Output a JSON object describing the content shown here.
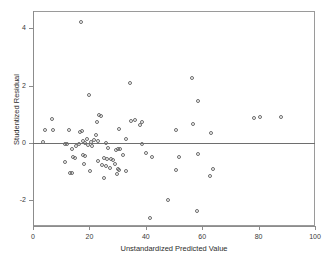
{
  "chart_data": {
    "type": "scatter",
    "title": "",
    "xlabel": "Unstandardized Predicted Value",
    "ylabel": "Studentized Residual",
    "xlim": [
      0,
      100
    ],
    "ylim": [
      -2.9,
      4.6
    ],
    "xticks": [
      0,
      20,
      40,
      60,
      80,
      100
    ],
    "xticklabels": [
      "0",
      "20",
      "40",
      "60",
      "80",
      "100"
    ],
    "yticks": [
      4,
      2,
      0,
      -2
    ],
    "yticklabels": [
      "4",
      "2",
      "0",
      "-2"
    ],
    "grid": false,
    "legend": null,
    "reference_line": {
      "type": "horizontal",
      "y": 0
    },
    "marker": {
      "shape": "circle",
      "filled": false,
      "edge_color": "#6b6b6b",
      "size": 4
    },
    "points": [
      {
        "x": 17.0,
        "y": 4.22
      },
      {
        "x": 56.5,
        "y": 2.25
      },
      {
        "x": 34.5,
        "y": 2.1
      },
      {
        "x": 19.8,
        "y": 1.67
      },
      {
        "x": 58.5,
        "y": 1.47
      },
      {
        "x": 23.4,
        "y": 0.97
      },
      {
        "x": 24.1,
        "y": 0.95
      },
      {
        "x": 88.0,
        "y": 0.9
      },
      {
        "x": 80.5,
        "y": 0.9
      },
      {
        "x": 78.2,
        "y": 0.88
      },
      {
        "x": 6.8,
        "y": 0.84
      },
      {
        "x": 36.2,
        "y": 0.79
      },
      {
        "x": 34.8,
        "y": 0.76
      },
      {
        "x": 38.8,
        "y": 0.74
      },
      {
        "x": 22.8,
        "y": 0.73
      },
      {
        "x": 56.8,
        "y": 0.67
      },
      {
        "x": 37.8,
        "y": 0.63
      },
      {
        "x": 30.5,
        "y": 0.48
      },
      {
        "x": 50.8,
        "y": 0.45
      },
      {
        "x": 12.6,
        "y": 0.44
      },
      {
        "x": 4.3,
        "y": 0.44
      },
      {
        "x": 7.2,
        "y": 0.45
      },
      {
        "x": 17.2,
        "y": 0.41
      },
      {
        "x": 16.8,
        "y": 0.37
      },
      {
        "x": 63.2,
        "y": 0.34
      },
      {
        "x": 22.4,
        "y": 0.29
      },
      {
        "x": 33.0,
        "y": 0.14
      },
      {
        "x": 19.2,
        "y": 0.14
      },
      {
        "x": 21.6,
        "y": 0.11
      },
      {
        "x": 17.6,
        "y": 0.08
      },
      {
        "x": 23.0,
        "y": 0.07
      },
      {
        "x": 20.4,
        "y": 0.04
      },
      {
        "x": 3.6,
        "y": 0.04
      },
      {
        "x": 18.6,
        "y": -0.01
      },
      {
        "x": 25.8,
        "y": -0.02
      },
      {
        "x": 38.6,
        "y": -0.03
      },
      {
        "x": 11.2,
        "y": -0.04
      },
      {
        "x": 12.2,
        "y": -0.05
      },
      {
        "x": 16.2,
        "y": -0.05
      },
      {
        "x": 19.6,
        "y": -0.09
      },
      {
        "x": 20.8,
        "y": -0.1
      },
      {
        "x": 15.4,
        "y": -0.12
      },
      {
        "x": 26.6,
        "y": -0.17
      },
      {
        "x": 30.1,
        "y": -0.2
      },
      {
        "x": 30.8,
        "y": -0.22
      },
      {
        "x": 29.6,
        "y": -0.24
      },
      {
        "x": 13.8,
        "y": -0.2
      },
      {
        "x": 40.2,
        "y": -0.35
      },
      {
        "x": 31.8,
        "y": -0.42
      },
      {
        "x": 17.6,
        "y": -0.44
      },
      {
        "x": 18.6,
        "y": -0.46
      },
      {
        "x": 42.2,
        "y": -0.48
      },
      {
        "x": 14.2,
        "y": -0.5
      },
      {
        "x": 15.0,
        "y": -0.52
      },
      {
        "x": 51.6,
        "y": -0.5
      },
      {
        "x": 25.0,
        "y": -0.52
      },
      {
        "x": 26.2,
        "y": -0.55
      },
      {
        "x": 27.6,
        "y": -0.57
      },
      {
        "x": 58.4,
        "y": -0.4
      },
      {
        "x": 28.4,
        "y": -0.6
      },
      {
        "x": 23.2,
        "y": -0.64
      },
      {
        "x": 11.4,
        "y": -0.68
      },
      {
        "x": 18.0,
        "y": -0.72
      },
      {
        "x": 29.0,
        "y": -0.74
      },
      {
        "x": 24.6,
        "y": -0.78
      },
      {
        "x": 26.0,
        "y": -0.82
      },
      {
        "x": 27.2,
        "y": -0.86
      },
      {
        "x": 63.8,
        "y": -0.9
      },
      {
        "x": 50.6,
        "y": -0.94
      },
      {
        "x": 20.2,
        "y": -0.97
      },
      {
        "x": 30.0,
        "y": -0.9
      },
      {
        "x": 30.6,
        "y": -0.96
      },
      {
        "x": 33.0,
        "y": -0.98
      },
      {
        "x": 13.0,
        "y": -1.04
      },
      {
        "x": 13.8,
        "y": -1.05
      },
      {
        "x": 29.8,
        "y": -1.07
      },
      {
        "x": 62.6,
        "y": -1.15
      },
      {
        "x": 25.2,
        "y": -1.22
      },
      {
        "x": 48.0,
        "y": -2.0
      },
      {
        "x": 58.0,
        "y": -2.38
      },
      {
        "x": 41.6,
        "y": -2.62
      }
    ]
  }
}
